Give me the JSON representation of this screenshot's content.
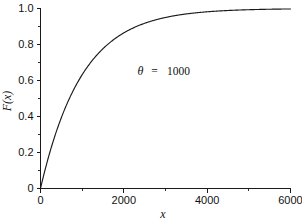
{
  "chart_data": {
    "type": "line",
    "title": "",
    "xlabel": "x",
    "ylabel": "F(x)",
    "xlim": [
      0,
      6000
    ],
    "ylim": [
      0,
      1.0
    ],
    "grid": false,
    "legend": null,
    "annotations": [
      {
        "symbol": "θ",
        "equals": "=",
        "value": "1000",
        "text": "θ = 1000",
        "x": 3000,
        "y": 0.63
      }
    ],
    "x_ticks_major": [
      0,
      2000,
      4000,
      6000
    ],
    "x_tick_labels": [
      "0",
      "2000",
      "4000",
      "6000"
    ],
    "x_ticks_minor": [
      1000,
      3000,
      5000
    ],
    "y_ticks_major": [
      0,
      0.2,
      0.4,
      0.6,
      0.8,
      1.0
    ],
    "y_tick_labels": [
      "0",
      "0.2",
      "0.4",
      "0.6",
      "0.8",
      "1.0"
    ],
    "y_ticks_minor": [
      0.1,
      0.3,
      0.5,
      0.7,
      0.9
    ],
    "series": [
      {
        "name": "F(x) = 1 - exp(-x/1000)",
        "theta": 1000,
        "x": [
          0,
          100,
          200,
          300,
          400,
          500,
          600,
          700,
          800,
          900,
          1000,
          1200,
          1400,
          1600,
          1800,
          2000,
          2250,
          2500,
          2750,
          3000,
          3250,
          3500,
          3750,
          4000,
          4500,
          5000,
          5500,
          6000
        ],
        "values": [
          0.0,
          0.0952,
          0.1813,
          0.2592,
          0.3297,
          0.3935,
          0.4512,
          0.5034,
          0.5507,
          0.5934,
          0.6321,
          0.6988,
          0.7534,
          0.7981,
          0.8347,
          0.8647,
          0.8946,
          0.9179,
          0.9361,
          0.9502,
          0.9612,
          0.9698,
          0.9765,
          0.9817,
          0.9889,
          0.9933,
          0.9959,
          0.9975
        ]
      }
    ],
    "curve_color": "#1a1a1a",
    "axis_color": "#1a1a1a",
    "background_color": "#ffffff"
  }
}
